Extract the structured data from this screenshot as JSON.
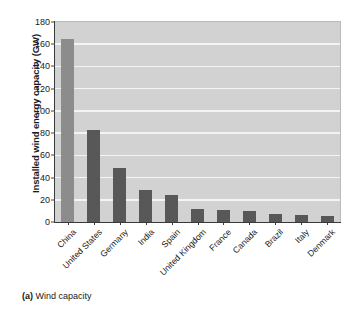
{
  "caption": {
    "tag": "(a)",
    "text": "Wind capacity"
  },
  "colors": {
    "plot_background": "#d2d2d2",
    "gridline": "#f4f4f4",
    "bar_default": "#585858",
    "bar_highlight": "#8c8c8c",
    "axis": "#3a3a3a",
    "text": "#1a1a1a"
  },
  "chart_data": {
    "type": "bar",
    "title": "",
    "subtitle": "",
    "xlabel": "",
    "ylabel": "Installed wind energy capacity (GW)",
    "ylim": [
      0,
      180
    ],
    "ytick_step": 20,
    "yticks": [
      0,
      20,
      40,
      60,
      80,
      100,
      120,
      140,
      160,
      180
    ],
    "ytick_labels": [
      "0",
      "20",
      "40",
      "60",
      "80",
      "100",
      "120",
      "140",
      "160",
      "180"
    ],
    "grid": true,
    "grid_axis": "y",
    "legend": false,
    "legend_position": "none",
    "categories": [
      "China",
      "United States",
      "Germany",
      "India",
      "Spain",
      "United Kingdom",
      "France",
      "Canada",
      "Brazil",
      "Italy",
      "Denmark"
    ],
    "values": [
      165,
      83,
      49,
      29,
      24,
      12,
      11,
      10,
      7,
      6,
      5
    ],
    "units": "GW",
    "bar_colors": [
      "#8c8c8c",
      "#585858",
      "#585858",
      "#585858",
      "#585858",
      "#585858",
      "#585858",
      "#585858",
      "#585858",
      "#585858",
      "#585858"
    ]
  }
}
